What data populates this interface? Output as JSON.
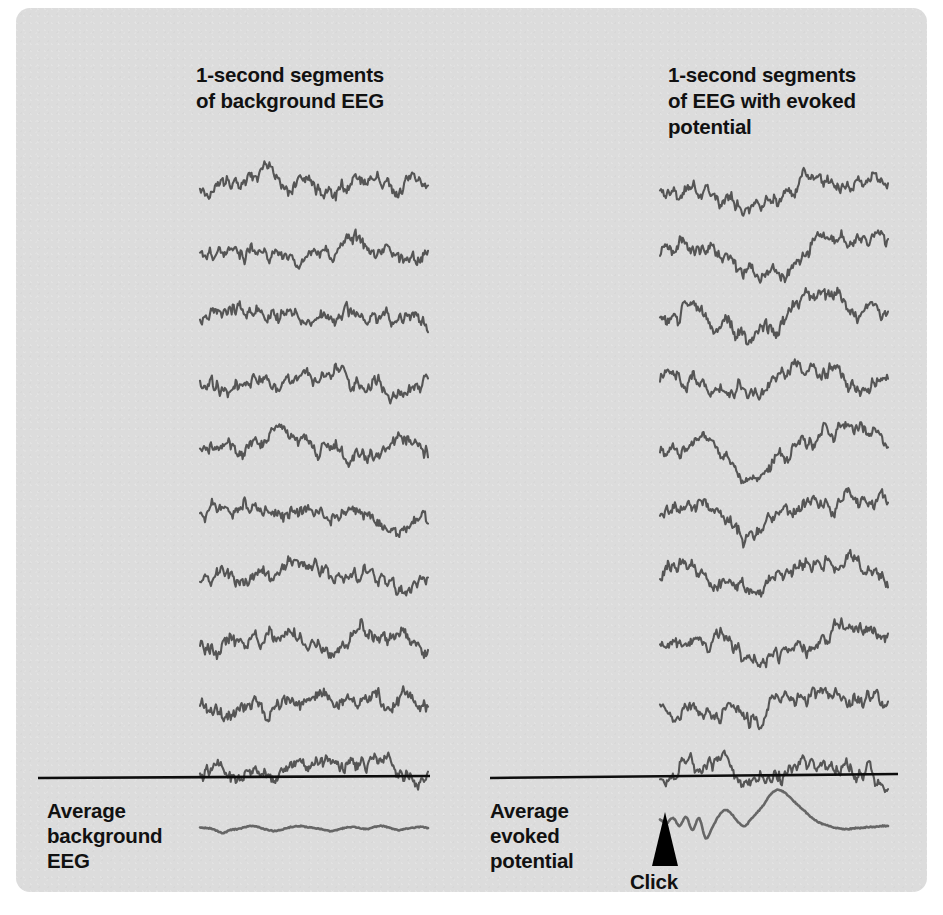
{
  "figure": {
    "background_color": "#dcdcdc",
    "page_color": "#ffffff",
    "trace_color": "#555555",
    "average_trace_color": "#666666",
    "rule_color": "#0d0d0d",
    "marker_color": "#000000"
  },
  "columns": {
    "left": {
      "title": "1-second segments\nof background EEG",
      "average_label": "Average\nbackground\nEEG",
      "segment_count": 10
    },
    "right": {
      "title": "1-second segments\nof EEG with evoked\npotential",
      "average_label": "Average\nevoked\npotential",
      "segment_count": 10,
      "marker_label": "Click",
      "marker_icon": "up-triangle-marker"
    }
  },
  "chart_data": {
    "type": "line",
    "xlabel": "Time (1-second segment)",
    "ylabel": "EEG amplitude",
    "grid": false,
    "legend": "none",
    "xlim": [
      0,
      1
    ],
    "series_groups": [
      {
        "name": "background EEG segments",
        "description": "Ten 1-second raw EEG traces containing only background activity; no time-locked response is visible.",
        "x_range_px": [
          200,
          428
        ],
        "row_baselines_px": [
          186,
          251,
          316,
          381,
          446,
          511,
          576,
          641,
          706,
          745
        ],
        "noise_amplitude": 9,
        "evoked_amplitude": 0,
        "seeds": [
          11,
          23,
          37,
          49,
          61,
          73,
          89,
          97,
          109,
          127
        ]
      },
      {
        "name": "EEG with evoked potential segments",
        "description": "Ten 1-second raw EEG traces, each containing the same time-locked evoked response buried in background noise.",
        "x_range_px": [
          660,
          888
        ],
        "row_baselines_px": [
          186,
          251,
          316,
          381,
          446,
          511,
          576,
          641,
          706,
          745
        ],
        "noise_amplitude": 9,
        "evoked_amplitude": 20,
        "seeds": [
          13,
          29,
          41,
          53,
          67,
          79,
          83,
          101,
          113,
          131
        ]
      }
    ],
    "averages": [
      {
        "name": "Average background EEG",
        "description": "Average of the ten background segments; random activity cancels leaving a nearly flat line.",
        "x_range_px": [
          200,
          428
        ],
        "baseline_px": 828,
        "points": [
          0,
          0,
          -2,
          -5,
          -2,
          -1,
          1,
          2,
          0,
          -2,
          -3,
          -1,
          1,
          2,
          1,
          0,
          -1,
          -3,
          -2,
          0,
          1,
          0,
          -1,
          1,
          2,
          0,
          -2,
          -1,
          0,
          1,
          0
        ]
      },
      {
        "name": "Average evoked potential",
        "description": "Average of the ten evoked segments; the time-locked response emerges from the noise as a distinct waveform.",
        "x_range_px": [
          660,
          888
        ],
        "baseline_px": 820,
        "marker_x_px": 665,
        "points": [
          0,
          -3,
          2,
          -6,
          3,
          -10,
          2,
          -18,
          -8,
          4,
          10,
          6,
          -2,
          -6,
          1,
          8,
          16,
          26,
          30,
          28,
          22,
          16,
          10,
          4,
          -1,
          -4,
          -6,
          -8,
          -9,
          -9,
          -8,
          -8,
          -7,
          -7,
          -6,
          -6
        ]
      }
    ]
  }
}
